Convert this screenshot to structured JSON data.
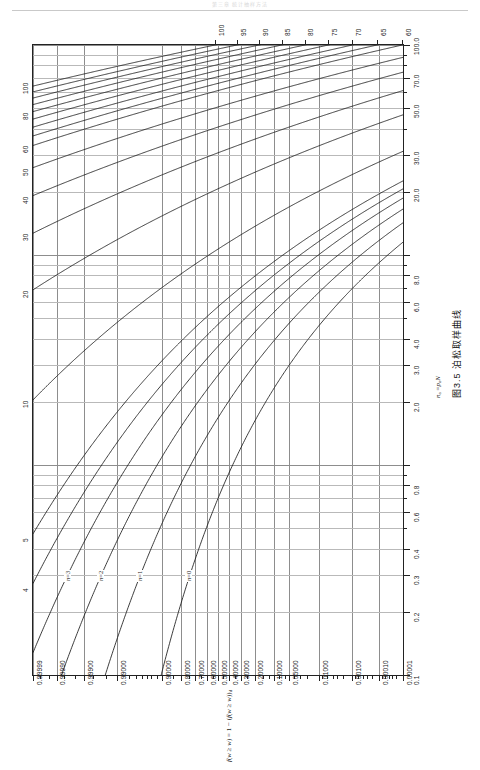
{
  "page": {
    "header_text": "第三章 统计抽样方法",
    "figure_caption": "图3.5  泊松取样曲线"
  },
  "axes": {
    "bottom": {
      "caption_html": "f(w ≥ w) = 1 − f_d(w ≥ w)",
      "caption_plain": "f(w≥w)=1-f(w≥w)d",
      "labels": [
        "0.99999",
        "0.99990",
        "0.99900",
        "0.99000",
        "0.90000",
        "0.80000",
        "0.70000",
        "0.60000",
        "0.50000",
        "0.40000",
        "0.30000",
        "0.20000",
        "0.10000",
        "0.05000",
        "0.01000",
        "0.00100",
        "0.00010",
        "0.00001"
      ]
    },
    "right": {
      "caption_plain": "na = pa N",
      "labels": [
        "0.1",
        "0.2",
        "0.3",
        "0.4",
        "0.6",
        "0.8",
        "2.0",
        "3.0",
        "4.0",
        "6.0",
        "8.0",
        "20.0",
        "30.0",
        "50.0",
        "70.0",
        "100.0"
      ]
    },
    "left": {
      "labels": [
        "4",
        "5",
        "10",
        "20",
        "30",
        "40",
        "50",
        "60",
        "80",
        "100"
      ]
    },
    "top": {
      "labels": [
        "60",
        "65",
        "70",
        "75",
        "80",
        "85",
        "90",
        "95",
        "100"
      ]
    }
  },
  "curves": {
    "labels": [
      "n=0",
      "n=1",
      "n=2",
      "n=3"
    ]
  },
  "chart_data": {
    "type": "line",
    "title": "图3.5  泊松取样曲线",
    "subtitle": "Poisson sampling curves (nomogram)",
    "xlabel": "f(w ≥ w) = 1 − f_d(w ≥ w)",
    "ylabel": "na = pa N",
    "grid": true,
    "legend": "inline-curve-labels",
    "xscale": "probability (reversed, log-odds style)",
    "yscale": "log",
    "xlim": [
      0.99999,
      1e-05
    ],
    "ylim": [
      0.1,
      100.0
    ],
    "x_tick_labels": [
      "0.99999",
      "0.99990",
      "0.99900",
      "0.99000",
      "0.90000",
      "0.80000",
      "0.70000",
      "0.60000",
      "0.50000",
      "0.40000",
      "0.30000",
      "0.20000",
      "0.10000",
      "0.05000",
      "0.01000",
      "0.00100",
      "0.00010",
      "0.00001"
    ],
    "y_tick_labels_right": [
      "0.1",
      "0.2",
      "0.3",
      "0.4",
      "0.6",
      "0.8",
      "2.0",
      "3.0",
      "4.0",
      "6.0",
      "8.0",
      "20.0",
      "30.0",
      "50.0",
      "70.0",
      "100.0"
    ],
    "y_tick_labels_left": [
      "4",
      "5",
      "10",
      "20",
      "30",
      "40",
      "50",
      "60",
      "80",
      "100"
    ],
    "top_tick_labels": [
      "60",
      "65",
      "70",
      "75",
      "80",
      "85",
      "90",
      "95",
      "100"
    ],
    "series": [
      {
        "name": "n=0",
        "n": 0,
        "comment": "cumulative Poisson probability curve for c=0 defects"
      },
      {
        "name": "n=1",
        "n": 1
      },
      {
        "name": "n=2",
        "n": 2
      },
      {
        "name": "n=3",
        "n": 3
      },
      {
        "name": "n=4",
        "n": 4
      },
      {
        "name": "n=5",
        "n": 5
      },
      {
        "name": "n=10",
        "n": 10
      },
      {
        "name": "n=20",
        "n": 20
      },
      {
        "name": "n=30",
        "n": 30
      },
      {
        "name": "n=40",
        "n": 40
      },
      {
        "name": "n=50",
        "n": 50
      },
      {
        "name": "n=60",
        "n": 60
      },
      {
        "name": "n=65",
        "n": 65
      },
      {
        "name": "n=70",
        "n": 70
      },
      {
        "name": "n=75",
        "n": 75
      },
      {
        "name": "n=80",
        "n": 80
      },
      {
        "name": "n=85",
        "n": 85
      },
      {
        "name": "n=90",
        "n": 90
      },
      {
        "name": "n=95",
        "n": 95
      },
      {
        "name": "n=100",
        "n": 100
      }
    ]
  }
}
